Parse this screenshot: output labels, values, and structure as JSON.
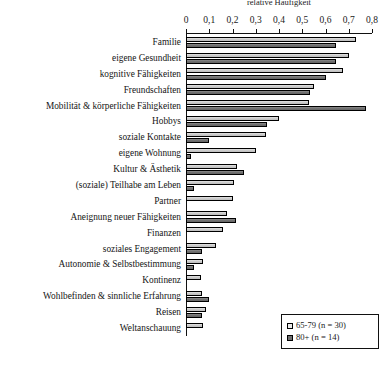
{
  "chart_data": {
    "type": "bar",
    "orientation": "horizontal",
    "title": "relative Häufigkeit",
    "xlabel": "",
    "ylabel": "",
    "xlim": [
      0,
      0.8
    ],
    "xticks": [
      "0",
      "0,1",
      "0,2",
      "0,3",
      "0,4",
      "0,5",
      "0,6",
      "0,7",
      "0,8"
    ],
    "xtick_values": [
      0,
      0.1,
      0.2,
      0.3,
      0.4,
      0.5,
      0.6,
      0.7,
      0.8
    ],
    "grid": false,
    "legend_position": "bottom-right",
    "categories": [
      "Familie",
      "eigene Gesundheit",
      "kognitive Fähigkeiten",
      "Freundschaften",
      "Mobilität & körperliche Fähigkeiten",
      "Hobbys",
      "soziale Kontakte",
      "eigene Wohnung",
      "Kultur & Ästhetik",
      "(soziale) Teilhabe am Leben",
      "Partner",
      "Aneignung neuer Fähigkeiten",
      "Finanzen",
      "soziales Engagement",
      "Autonomie & Selbstbestimmung",
      "Kontinenz",
      "Wohlbefinden & sinnliche Erfahrung",
      "Reisen",
      "Weltanschauung"
    ],
    "series": [
      {
        "name": "65-79 (n = 30)",
        "color": "#c9c9c9",
        "values": [
          0.73,
          0.7,
          0.675,
          0.55,
          0.53,
          0.4,
          0.345,
          0.3,
          0.22,
          0.205,
          0.2,
          0.175,
          0.16,
          0.13,
          0.075,
          0.065,
          0.07,
          0.085,
          0.075
        ]
      },
      {
        "name": "80+ (n = 14)",
        "color": "#6e6e6e",
        "values": [
          0.645,
          0.645,
          0.6,
          0.535,
          0.775,
          0.35,
          0.1,
          0.02,
          0.25,
          0.035,
          0.0,
          0.215,
          0.0,
          0.07,
          0.035,
          0.0,
          0.1,
          0.07,
          0.0
        ]
      }
    ]
  },
  "legend": {
    "items": [
      {
        "label": "65-79 (n = 30)",
        "swatch": "light"
      },
      {
        "label": "80+ (n = 14)",
        "swatch": "dark"
      }
    ]
  }
}
